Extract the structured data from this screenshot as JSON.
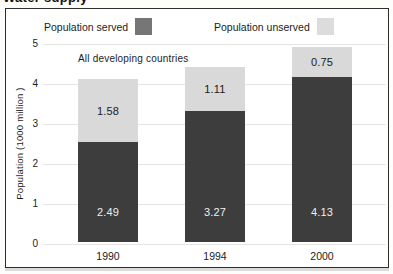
{
  "page": {
    "cropped_heading": "Water supply"
  },
  "legend": {
    "served_label": "Population served",
    "unserved_label": "Population unserved"
  },
  "chart_data": {
    "type": "bar",
    "stacked": true,
    "title": "All developing countries",
    "ylabel": "Population (1000 million )",
    "categories": [
      "1990",
      "1994",
      "2000"
    ],
    "series": [
      {
        "name": "Population served",
        "values": [
          2.49,
          3.27,
          4.13
        ]
      },
      {
        "name": "Population unserved",
        "values": [
          1.58,
          1.11,
          0.75
        ]
      }
    ],
    "totals": [
      4.07,
      4.38,
      4.88
    ],
    "ylim": [
      0,
      5
    ],
    "yticks": [
      0,
      1,
      2,
      3,
      4,
      5
    ],
    "grid": true,
    "legend_position": "top"
  },
  "colors": {
    "served_bar": "#3d3d3d",
    "unserved_bar": "#d9d9d9",
    "served_legend_swatch": "#767676",
    "unserved_legend_swatch": "#dcdcdc",
    "gridline": "#e4e4e2",
    "frame_border": "#2e2e2e",
    "background": "#ffffff"
  }
}
